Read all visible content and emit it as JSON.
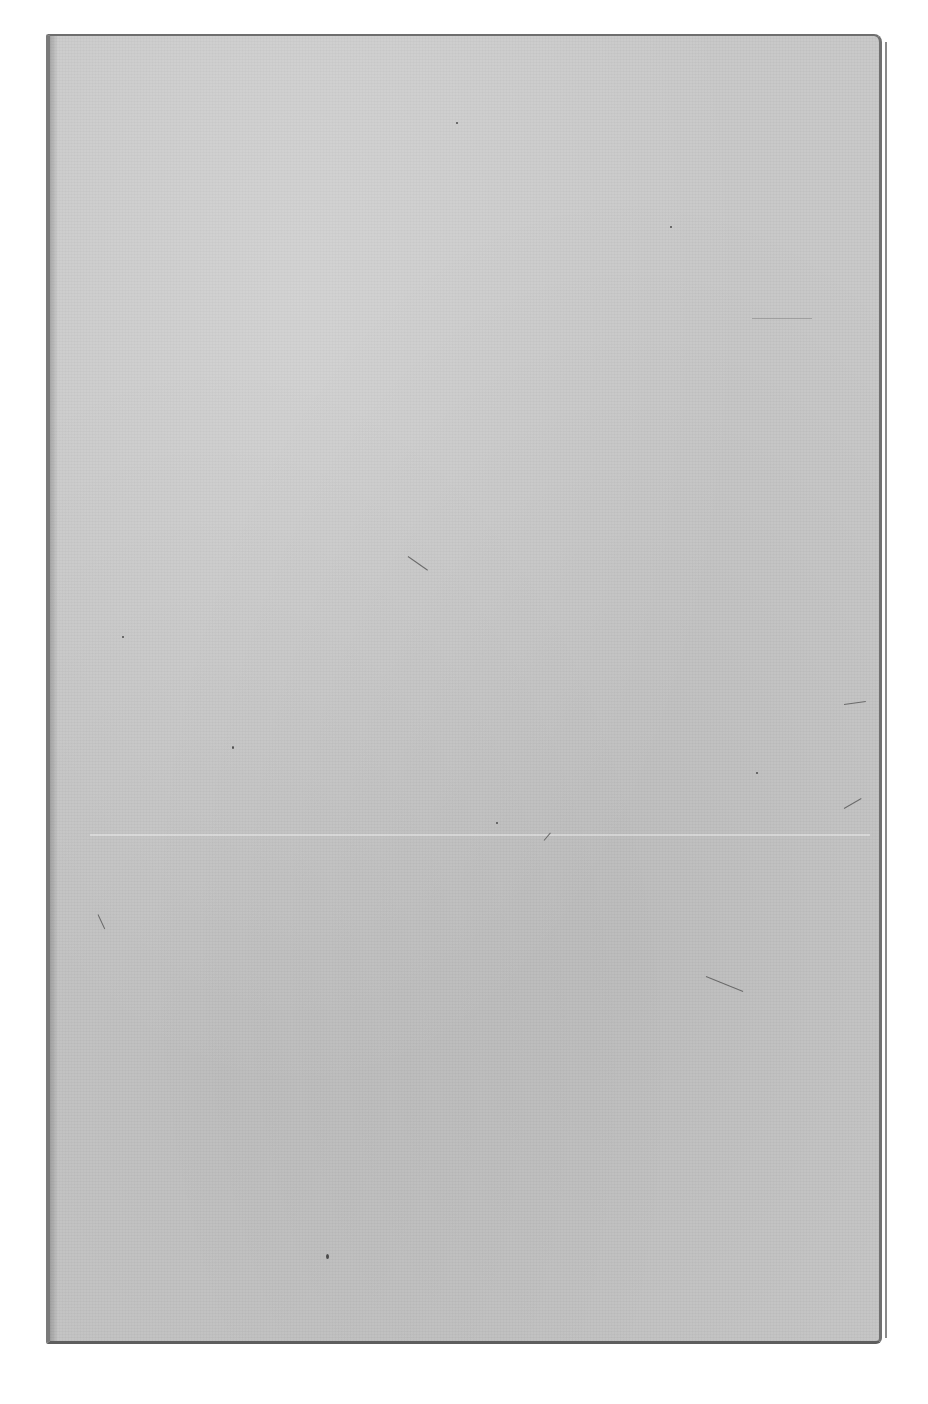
{
  "page": {
    "type": "blank scanned book cover",
    "text": "",
    "colors": {
      "background": "#ffffff",
      "cover": "#c9c9c9",
      "edge": "#6e6e6e"
    }
  }
}
